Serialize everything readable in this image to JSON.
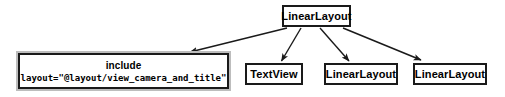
{
  "diagram": {
    "type": "tree",
    "background_color": "#ffffff",
    "node_border_color": "#1a1a1a",
    "node_fill_color": "#ffffff",
    "edge_color": "#1a1a1a",
    "nodes": [
      {
        "id": "root",
        "label": "LinearLayout",
        "role": "root-container"
      },
      {
        "id": "include",
        "label": "include",
        "attribute": "layout=\"@layout/view_camera_and_title\"",
        "role": "included-layout"
      },
      {
        "id": "textview",
        "label": "TextView",
        "role": "child"
      },
      {
        "id": "linear-2",
        "label": "LinearLayout",
        "role": "child"
      },
      {
        "id": "linear-3",
        "label": "LinearLayout",
        "role": "child"
      }
    ],
    "edges": [
      {
        "from": "root",
        "to": "include"
      },
      {
        "from": "root",
        "to": "textview"
      },
      {
        "from": "root",
        "to": "linear-2"
      },
      {
        "from": "root",
        "to": "linear-3"
      }
    ]
  }
}
